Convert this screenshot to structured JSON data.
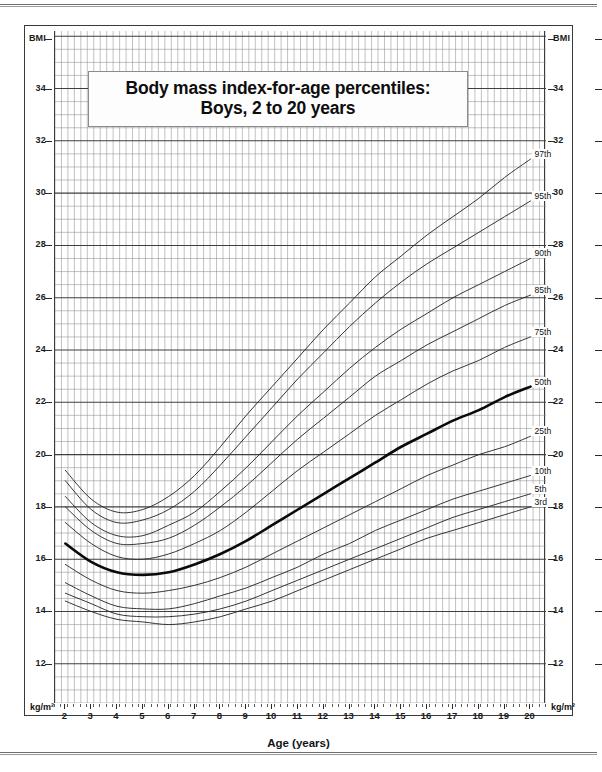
{
  "title": {
    "line1": "Body mass index-for-age percentiles:",
    "line2": "Boys, 2 to 20 years"
  },
  "axes": {
    "y_left_top_label": "BMI",
    "y_right_top_label": "BMI",
    "y_left_unit": "kg/m²",
    "y_right_unit": "kg/m²",
    "x_title": "Age (years)",
    "y_ticks": [
      34,
      32,
      30,
      28,
      26,
      24,
      22,
      20,
      18,
      16,
      14,
      12
    ],
    "y_range": [
      10.5,
      36.2
    ],
    "y_minor_step": 0.5,
    "y_major_step": 2,
    "x_ticks": [
      2,
      3,
      4,
      5,
      6,
      7,
      8,
      9,
      10,
      11,
      12,
      13,
      14,
      15,
      16,
      17,
      18,
      19,
      20
    ],
    "x_range": [
      1.6,
      20.6
    ],
    "x_minor_step": 0.25,
    "x_major_step": 1
  },
  "colors": {
    "grid_minor": "#8f8f8f",
    "grid_major": "#3f3f3f",
    "curve": "#2b2b2b",
    "curve_highlight": "#0a0a0a",
    "frame": "#3a3a3a",
    "page_background": "#ffffff"
  },
  "chart_data": {
    "type": "line",
    "title": "Body mass index-for-age percentiles: Boys, 2 to 20 years",
    "xlabel": "Age (years)",
    "ylabel": "BMI",
    "y2label": "BMI",
    "unit": "kg/m²",
    "xlim": [
      1.6,
      20.6
    ],
    "ylim": [
      10.5,
      36.2
    ],
    "grid": true,
    "legend": "inline-right-end-labels",
    "x": [
      2,
      3,
      4,
      5,
      6,
      7,
      8,
      9,
      10,
      11,
      12,
      13,
      14,
      15,
      16,
      17,
      18,
      19,
      20
    ],
    "series": [
      {
        "name": "97th",
        "label": "97th",
        "highlight": false,
        "values": [
          19.4,
          18.3,
          17.8,
          17.9,
          18.4,
          19.2,
          20.3,
          21.5,
          22.6,
          23.7,
          24.8,
          25.8,
          26.8,
          27.6,
          28.4,
          29.1,
          29.8,
          30.6,
          31.3
        ]
      },
      {
        "name": "95th",
        "label": "95th",
        "highlight": false,
        "values": [
          19.0,
          17.9,
          17.4,
          17.5,
          17.9,
          18.6,
          19.6,
          20.7,
          21.8,
          22.9,
          23.9,
          24.9,
          25.8,
          26.6,
          27.3,
          27.9,
          28.5,
          29.1,
          29.7
        ]
      },
      {
        "name": "90th",
        "label": "90th",
        "highlight": false,
        "values": [
          18.4,
          17.4,
          16.9,
          16.9,
          17.3,
          17.8,
          18.6,
          19.5,
          20.5,
          21.5,
          22.4,
          23.3,
          24.1,
          24.8,
          25.4,
          26.0,
          26.5,
          27.0,
          27.5
        ]
      },
      {
        "name": "85th",
        "label": "85th",
        "highlight": false,
        "values": [
          18.0,
          17.1,
          16.6,
          16.6,
          16.8,
          17.3,
          18.0,
          18.8,
          19.7,
          20.6,
          21.4,
          22.2,
          23.0,
          23.6,
          24.2,
          24.7,
          25.2,
          25.7,
          26.1
        ]
      },
      {
        "name": "75th",
        "label": "75th",
        "highlight": false,
        "values": [
          17.4,
          16.6,
          16.1,
          16.0,
          16.2,
          16.6,
          17.1,
          17.8,
          18.6,
          19.4,
          20.1,
          20.8,
          21.5,
          22.1,
          22.7,
          23.2,
          23.6,
          24.1,
          24.5
        ]
      },
      {
        "name": "50th",
        "label": "50th",
        "highlight": true,
        "values": [
          16.6,
          15.9,
          15.5,
          15.4,
          15.5,
          15.8,
          16.2,
          16.7,
          17.3,
          17.9,
          18.5,
          19.1,
          19.7,
          20.3,
          20.8,
          21.3,
          21.7,
          22.2,
          22.6
        ]
      },
      {
        "name": "25th",
        "label": "25th",
        "highlight": false,
        "values": [
          15.8,
          15.2,
          14.8,
          14.7,
          14.8,
          15.0,
          15.3,
          15.7,
          16.2,
          16.7,
          17.2,
          17.7,
          18.2,
          18.7,
          19.2,
          19.6,
          20.0,
          20.3,
          20.7
        ]
      },
      {
        "name": "10th",
        "label": "10th",
        "highlight": false,
        "values": [
          15.1,
          14.6,
          14.2,
          14.1,
          14.1,
          14.3,
          14.6,
          14.9,
          15.3,
          15.7,
          16.2,
          16.6,
          17.1,
          17.5,
          17.9,
          18.3,
          18.6,
          18.9,
          19.2
        ]
      },
      {
        "name": "5th",
        "label": "5th",
        "highlight": false,
        "values": [
          14.7,
          14.3,
          13.9,
          13.8,
          13.8,
          13.9,
          14.1,
          14.4,
          14.8,
          15.2,
          15.6,
          16.0,
          16.4,
          16.8,
          17.2,
          17.6,
          17.9,
          18.2,
          18.5
        ]
      },
      {
        "name": "3rd",
        "label": "3rd",
        "highlight": false,
        "values": [
          14.4,
          14.0,
          13.7,
          13.6,
          13.5,
          13.6,
          13.8,
          14.1,
          14.4,
          14.8,
          15.2,
          15.6,
          16.0,
          16.4,
          16.8,
          17.1,
          17.4,
          17.7,
          18.0
        ]
      }
    ]
  }
}
